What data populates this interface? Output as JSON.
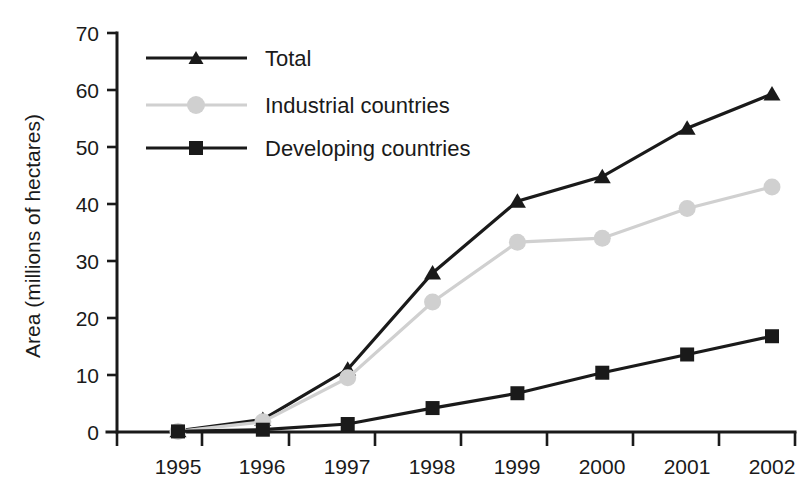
{
  "chart_data": {
    "type": "line",
    "title": "",
    "xlabel": "",
    "ylabel": "Area (millions of hectares)",
    "categories": [
      "1995",
      "1996",
      "1997",
      "1998",
      "1999",
      "2000",
      "2001",
      "2002"
    ],
    "x": [
      1995,
      1996,
      1997,
      1998,
      1999,
      2000,
      2001,
      2002
    ],
    "ylim": [
      0,
      70
    ],
    "yticks": [
      0,
      10,
      20,
      30,
      40,
      50,
      60,
      70
    ],
    "ytick_labels": [
      "0",
      "10",
      "20",
      "30",
      "40",
      "50",
      "60",
      "70"
    ],
    "grid": false,
    "legend_position": "upper-left-inside",
    "series": [
      {
        "name": "Total",
        "values": [
          0.2,
          2.2,
          11.0,
          27.9,
          40.5,
          44.8,
          53.3,
          59.3
        ],
        "color": "#1a1a1a",
        "marker": "triangle"
      },
      {
        "name": "Industrial countries",
        "values": [
          0.1,
          1.8,
          9.5,
          22.8,
          33.3,
          34.0,
          39.2,
          43.0
        ],
        "color": "#d0d0d0",
        "marker": "circle"
      },
      {
        "name": "Developing countries",
        "values": [
          0.1,
          0.4,
          1.4,
          4.2,
          6.8,
          10.4,
          13.6,
          16.8
        ],
        "color": "#1a1a1a",
        "marker": "square"
      }
    ]
  },
  "axes": {
    "y_axis_title": "Area (millions of hectares)",
    "y_tick_labels": [
      "70",
      "60",
      "50",
      "40",
      "30",
      "20",
      "10",
      "0"
    ],
    "x_tick_labels": [
      "1995",
      "1996",
      "1997",
      "1998",
      "1999",
      "2000",
      "2001",
      "2002"
    ]
  },
  "legend": {
    "entries": [
      {
        "label": "Total",
        "marker": "triangle-marker",
        "color": "#1a1a1a"
      },
      {
        "label": "Industrial countries",
        "marker": "circle-marker",
        "color": "#d0d0d0"
      },
      {
        "label": "Developing countries",
        "marker": "square-marker",
        "color": "#1a1a1a"
      }
    ]
  },
  "colors": {
    "foreground": "#1a1a1a",
    "industrial_gray": "#d0d0d0",
    "background": "#ffffff"
  }
}
